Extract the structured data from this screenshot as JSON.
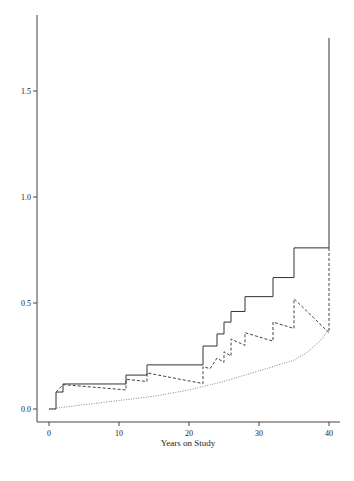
{
  "chart_data": {
    "type": "line",
    "title": "",
    "xlabel": "Years on Study",
    "ylabel": "",
    "xlim": [
      -2,
      42
    ],
    "ylim": [
      -0.06,
      1.85
    ],
    "x_ticks": [
      0,
      10,
      20,
      30,
      40
    ],
    "x_tick_labels": [
      "0",
      "10",
      "20",
      "30",
      "40"
    ],
    "y_ticks": [
      0.0,
      0.5,
      1.0,
      1.5
    ],
    "y_tick_labels": [
      "0.0",
      "0.5",
      "1.0",
      "1.5"
    ],
    "grid": false,
    "legend": null,
    "series": [
      {
        "name": "step estimate (solid)",
        "style": "solid",
        "kind": "step",
        "x": [
          0,
          1,
          2,
          11,
          14,
          22,
          24,
          25,
          26,
          28,
          32,
          35,
          40
        ],
        "y": [
          0.0,
          0.08,
          0.118,
          0.16,
          0.208,
          0.297,
          0.354,
          0.41,
          0.46,
          0.53,
          0.62,
          0.76,
          1.75
        ]
      },
      {
        "name": "smoothed/decaying estimate (dashed)",
        "style": "dashed",
        "kind": "sawtooth",
        "points": [
          [
            1,
            0.08
          ],
          [
            2,
            0.115
          ],
          [
            11,
            0.09
          ],
          [
            11,
            0.14
          ],
          [
            14,
            0.13
          ],
          [
            14,
            0.17
          ],
          [
            22,
            0.12
          ],
          [
            22,
            0.2
          ],
          [
            23,
            0.19
          ],
          [
            24,
            0.24
          ],
          [
            25,
            0.22
          ],
          [
            25,
            0.27
          ],
          [
            26,
            0.25
          ],
          [
            26,
            0.33
          ],
          [
            28,
            0.3
          ],
          [
            28,
            0.36
          ],
          [
            32,
            0.32
          ],
          [
            32,
            0.41
          ],
          [
            35,
            0.38
          ],
          [
            35,
            0.52
          ],
          [
            40,
            0.36
          ],
          [
            40,
            0.76
          ]
        ]
      },
      {
        "name": "smooth curve (dotted)",
        "style": "dotted",
        "kind": "line",
        "x": [
          0,
          5,
          10,
          15,
          20,
          25,
          30,
          33,
          35,
          37,
          39,
          40
        ],
        "y": [
          0.0,
          0.02,
          0.04,
          0.06,
          0.09,
          0.13,
          0.18,
          0.21,
          0.23,
          0.27,
          0.33,
          0.38
        ]
      }
    ]
  },
  "axes": {
    "xlabel": "Years on Study",
    "x_tick_labels": [
      "0",
      "10",
      "20",
      "30",
      "40"
    ],
    "y_tick_labels": [
      "0.0",
      "0.5",
      "1.0",
      "1.5"
    ]
  }
}
